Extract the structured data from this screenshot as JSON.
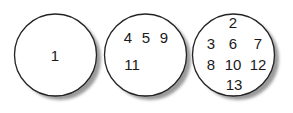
{
  "diagram": {
    "type": "partition-circles",
    "circles": [
      {
        "id": "circle-1",
        "rows": [
          [
            "1"
          ]
        ]
      },
      {
        "id": "circle-2",
        "rows": [
          [
            "4",
            "5",
            "9"
          ],
          [
            "11"
          ]
        ]
      },
      {
        "id": "circle-3",
        "rows": [
          [
            "2"
          ],
          [
            "3",
            "6",
            "7"
          ],
          [
            "8",
            "10",
            "12"
          ],
          [
            "13"
          ]
        ]
      }
    ]
  }
}
